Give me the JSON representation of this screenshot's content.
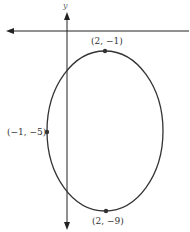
{
  "figure": {
    "axes": {
      "y_label": "y"
    },
    "ellipse": {
      "center": [
        2,
        -5
      ],
      "stroke_color": "#333333"
    },
    "points": [
      {
        "id": "top-vertex",
        "label": "(2, −1)",
        "coords": [
          2,
          -1
        ]
      },
      {
        "id": "left-covertex",
        "label": "(−1, −5)",
        "coords": [
          -1,
          -5
        ]
      },
      {
        "id": "bottom-vertex",
        "label": "(2, −9)",
        "coords": [
          2,
          -9
        ]
      }
    ],
    "colors": {
      "axis": "#222222",
      "curve": "#333333",
      "point": "#333333"
    }
  }
}
